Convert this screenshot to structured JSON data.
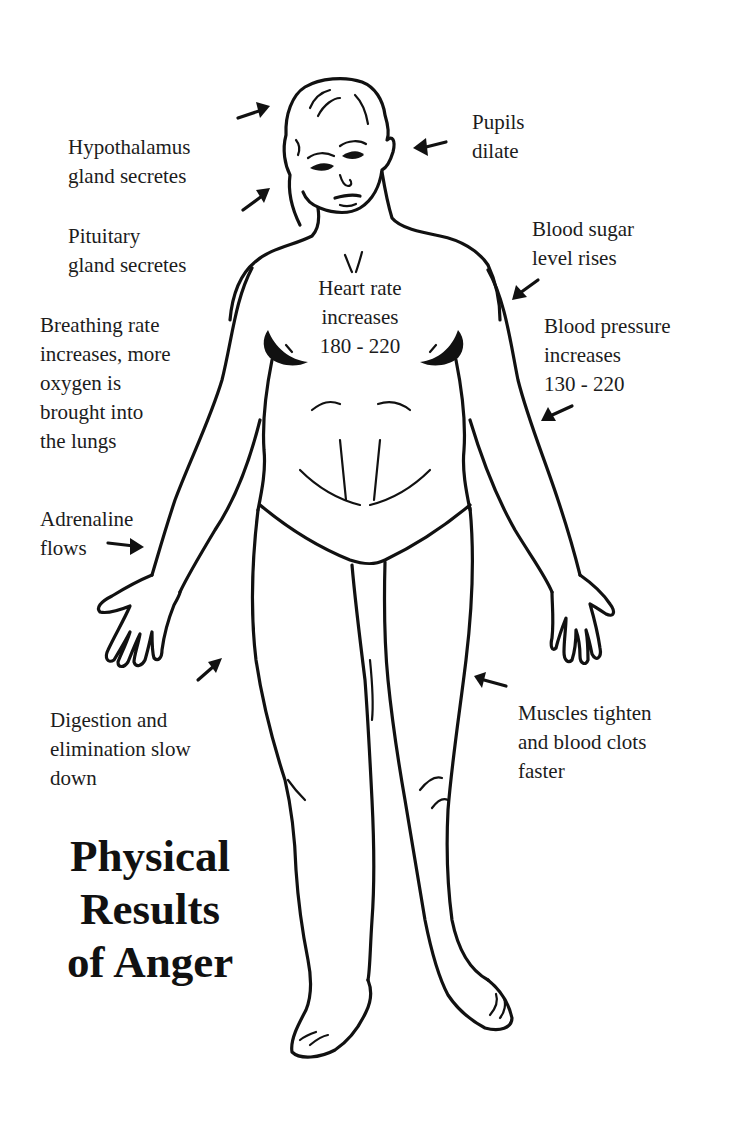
{
  "title": {
    "line1": "Physical",
    "line2": "Results",
    "line3": "of Anger"
  },
  "labels": {
    "hypothalamus": "Hypothalamus\ngland secretes",
    "pituitary": "Pituitary\ngland secretes",
    "pupils": "Pupils\ndilate",
    "blood_sugar": "Blood sugar\nlevel rises",
    "heart_rate": "Heart rate\nincreases\n180 - 220",
    "blood_pressure": "Blood pressure\nincreases\n130 - 220",
    "breathing": "Breathing rate\nincreases, more\noxygen is\nbrought into\nthe lungs",
    "adrenaline": "Adrenaline\nflows",
    "digestion": "Digestion and\nelimination slow\ndown",
    "muscles": "Muscles tighten\nand blood clots\nfaster"
  },
  "colors": {
    "ink": "#111111",
    "background": "#ffffff"
  },
  "figure": {
    "arrows": [
      "hypothalamus-arrow",
      "pituitary-arrow",
      "pupils-arrow",
      "blood-sugar-arrow",
      "blood-pressure-arrow",
      "adrenaline-arrow",
      "digestion-arrow",
      "muscles-arrow"
    ]
  }
}
